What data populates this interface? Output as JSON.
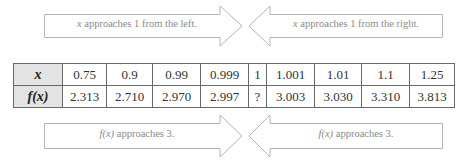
{
  "arrows": {
    "top_left": {
      "direction": "right",
      "var": "x",
      "text": " approaches 1 from the left."
    },
    "top_right": {
      "direction": "left",
      "var": "x",
      "text": " approaches 1 from the right."
    },
    "bottom_left": {
      "direction": "right",
      "var": "f(x)",
      "text": " approaches 3."
    },
    "bottom_right": {
      "direction": "left",
      "var": "f(x)",
      "text": " approaches 3."
    }
  },
  "table": {
    "row_headers": [
      "x",
      "f(x)"
    ],
    "x_values": [
      "0.75",
      "0.9",
      "0.99",
      "0.999",
      "1",
      "1.001",
      "1.01",
      "1.1",
      "1.25"
    ],
    "fx_values": [
      "2.313",
      "2.710",
      "2.970",
      "2.997",
      "?",
      "3.003",
      "3.030",
      "3.310",
      "3.813"
    ]
  },
  "colors": {
    "arrow_stroke": "#b5b5b5",
    "label_text": "#8a8a8a",
    "header_fill": "#e3e3e3",
    "border": "#6a6a6a"
  }
}
